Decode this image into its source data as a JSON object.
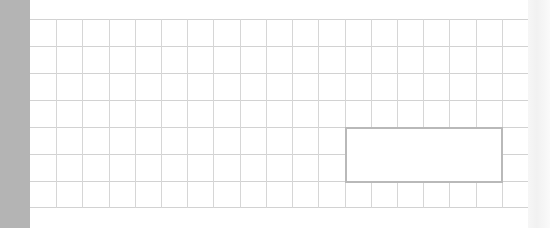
{
  "canvas": {
    "type": "grid-paper",
    "rows": 7,
    "columns": 19,
    "colors": {
      "background": "#ffffff",
      "left_bar": "#b4b4b4",
      "grid_line": "#d2d2d2",
      "selection_border": "#b9b9b9",
      "right_strip": "#f4f4f4"
    }
  },
  "selection": {
    "label": ""
  }
}
